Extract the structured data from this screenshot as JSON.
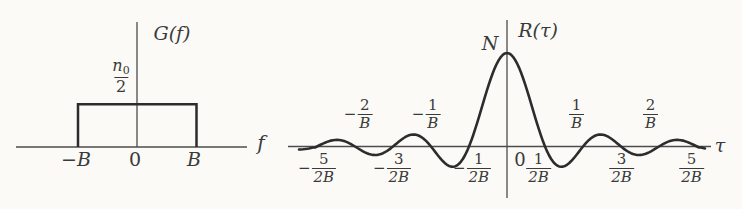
{
  "left_chart": {
    "y_axis_label": "G(f)",
    "x_axis_label": "f",
    "level": {
      "base": "n",
      "sub": "0",
      "den": "2"
    },
    "ticks": {
      "neg": "−B",
      "zero": "0",
      "pos": "B"
    }
  },
  "right_chart": {
    "y_axis_label": "R(τ)",
    "x_axis_label": "τ",
    "peak": "N",
    "origin": "0",
    "upper_ticks": [
      {
        "sign": "−",
        "num": "2",
        "den": "B"
      },
      {
        "sign": "−",
        "num": "1",
        "den": "B"
      },
      {
        "sign": "",
        "num": "1",
        "den": "B"
      },
      {
        "sign": "",
        "num": "2",
        "den": "B"
      }
    ],
    "lower_ticks": [
      {
        "sign": "−",
        "num": "5",
        "den": "2B"
      },
      {
        "sign": "−",
        "num": "3",
        "den": "2B"
      },
      {
        "sign": "−",
        "num": "1",
        "den": "2B"
      },
      {
        "sign": "",
        "num": "1",
        "den": "2B"
      },
      {
        "sign": "",
        "num": "3",
        "den": "2B"
      },
      {
        "sign": "",
        "num": "5",
        "den": "2B"
      }
    ]
  },
  "chart_data": [
    {
      "type": "line",
      "title": "",
      "ylabel": "G(f)",
      "xlabel": "f",
      "shape": "rectangular pulse",
      "function": "G(f) = n0/2 for −B ≤ f ≤ B, 0 elsewhere",
      "x_tick_labels": [
        "−B",
        "0",
        "B"
      ],
      "y_value_label": "n0/2",
      "x_range": [
        "−B",
        "B"
      ],
      "grid": false,
      "legend": false
    },
    {
      "type": "line",
      "title": "",
      "ylabel": "R(τ)",
      "xlabel": "τ",
      "shape": "sinc",
      "function": "R(τ) = N·sinc(2Bτ), peak N at τ = 0",
      "peak_label": "N",
      "zero_crossing_labels_below_axis": [
        "−5/2B",
        "−3/2B",
        "−1/2B",
        "0",
        "1/2B",
        "3/2B",
        "5/2B"
      ],
      "zero_crossing_labels_above_axis": [
        "−2/B",
        "−1/B",
        "1/B",
        "2/B"
      ],
      "grid": false,
      "legend": false
    }
  ]
}
